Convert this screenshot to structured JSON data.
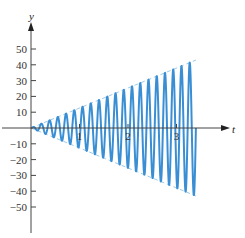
{
  "chart_data": {
    "type": "line",
    "title": "",
    "xlabel": "t",
    "ylabel": "y",
    "xlim": [
      0,
      3.9
    ],
    "ylim": [
      -55,
      55
    ],
    "grid": false,
    "legend": null,
    "x_ticks": [
      1,
      2,
      3
    ],
    "x_tick_labels": [
      "1",
      "2",
      "3"
    ],
    "y_ticks": [
      50,
      40,
      30,
      20,
      10,
      -10,
      -20,
      -30,
      -40,
      -50
    ],
    "y_tick_labels": [
      "50",
      "40",
      "30",
      "20",
      "10",
      "−10",
      "−20",
      "−30",
      "−40",
      "−50"
    ],
    "series": [
      {
        "name": "y = 12.7 t sin(ω t)",
        "style": "solid",
        "color": "#3a8fd4",
        "description": "oscillation with linearly growing amplitude (resonance), about 20 cycles over 0 ≤ t ≤ 3.4",
        "t_range": [
          0,
          3.4
        ],
        "amplitude_at_end": 43,
        "cycles": 20
      },
      {
        "name": "upper envelope y = 12.7 t",
        "style": "dashed",
        "color": "#9ccbe8",
        "x": [
          0,
          3.4
        ],
        "values": [
          0,
          43
        ]
      },
      {
        "name": "lower envelope y = -12.7 t",
        "style": "dashed",
        "color": "#9ccbe8",
        "x": [
          0,
          3.4
        ],
        "values": [
          0,
          -43
        ]
      }
    ]
  },
  "colors": {
    "curve": "#3a8fd4",
    "envelope": "#9ccbe8",
    "axis": "#444444"
  }
}
